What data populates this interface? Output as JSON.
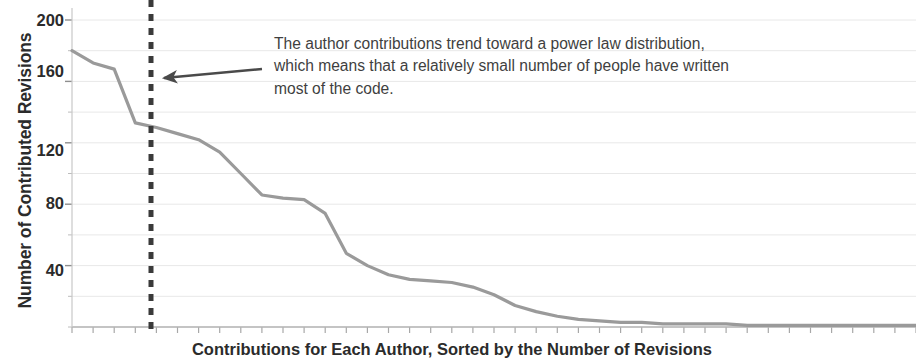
{
  "chart_data": {
    "type": "line",
    "title": "",
    "subtitle": "",
    "xlabel": "Contributions for Each Author, Sorted by the Number of Revisions",
    "ylabel": "Number of Contributed Revisions",
    "ylim": [
      0,
      200
    ],
    "yticks": [
      200,
      160,
      120,
      80,
      40
    ],
    "ytick_labels": [
      "200",
      "160",
      "120",
      "80",
      "40"
    ],
    "minor_gridlines_every": 20,
    "grid": true,
    "grid_color": "#e8e8e8",
    "legend": null,
    "line_color": "#9a9a9a",
    "line_width": 3.2,
    "xlim": [
      0,
      40
    ],
    "x": [
      0,
      1,
      2,
      3,
      4,
      5,
      6,
      7,
      8,
      9,
      10,
      11,
      12,
      13,
      14,
      15,
      16,
      17,
      18,
      19,
      20,
      21,
      22,
      23,
      24,
      25,
      26,
      27,
      28,
      29,
      30,
      31,
      32,
      33,
      34,
      35,
      36,
      37,
      38,
      39,
      40
    ],
    "values": [
      180,
      172,
      168,
      133,
      130,
      126,
      122,
      114,
      100,
      86,
      84,
      83,
      74,
      48,
      40,
      34,
      31,
      30,
      29,
      26,
      21,
      14,
      10,
      7,
      5,
      4,
      3,
      3,
      2,
      2,
      2,
      2,
      1,
      1,
      1,
      1,
      1,
      1,
      1,
      1,
      1
    ],
    "annotations": [
      {
        "name": "power-law-callout",
        "lines": [
          "The author contributions trend toward a power law distribution,",
          "which means that a relatively small number of people have written",
          "most of the code."
        ],
        "text_color": "#3f3f3f"
      }
    ],
    "markers": [
      {
        "name": "threshold-line",
        "type": "vertical-dashed-line",
        "x_pixel": 151,
        "color": "#3a3a3a",
        "dash": "7,7",
        "width": 5
      },
      {
        "name": "callout-arrow",
        "type": "arrow",
        "from_pixel": [
          262,
          69
        ],
        "to_pixel": [
          160,
          78
        ],
        "color": "#4a4a4a"
      }
    ]
  },
  "axis": {
    "y_label": "Number of Contributed Revisions",
    "x_label": "Contributions for Each Author, Sorted by the Number of Revisions",
    "y_ticks": [
      "200",
      "160",
      "120",
      "80",
      "40"
    ]
  },
  "annotation": {
    "line1": "The author contributions trend toward a power law distribution,",
    "line2": "which means that a relatively small number of people have written",
    "line3": "most of the code."
  },
  "colors": {
    "line": "#9a9a9a",
    "grid": "#e8e8e8",
    "axis": "#b0b0b0",
    "dashed_marker": "#3a3a3a",
    "arrow": "#4a4a4a",
    "text": "#2b2b2b",
    "annotation_text": "#3f3f3f",
    "background": "#ffffff"
  }
}
